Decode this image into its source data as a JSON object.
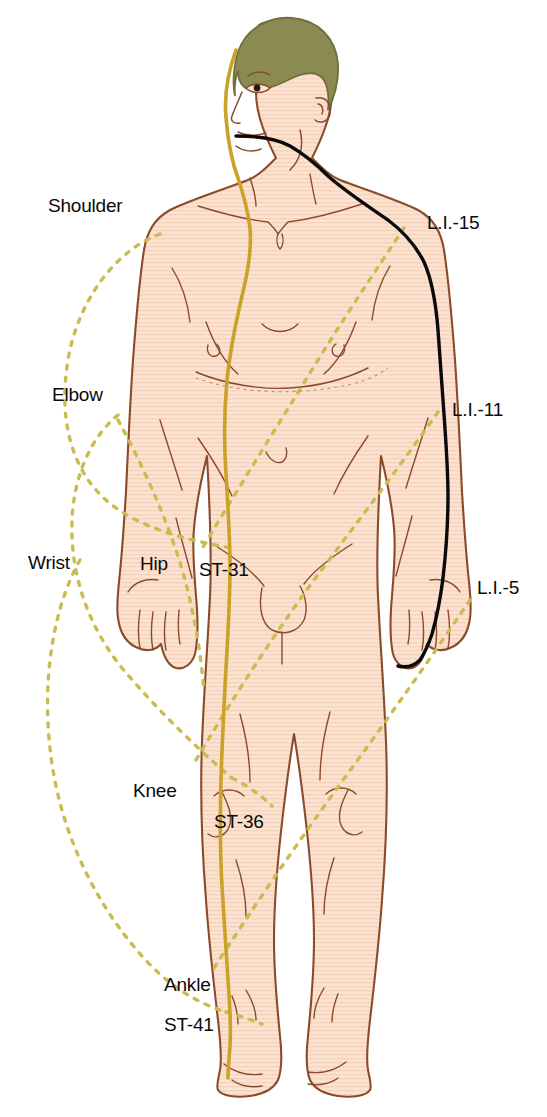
{
  "figure": {
    "background_color": "#ffffff"
  },
  "colors": {
    "skin_fill": "#fbe3d2",
    "skin_hatch": "#f3cdb6",
    "body_outline": "#8a4b2a",
    "hair_fill": "#8b8a52",
    "hair_outline": "#6f6e3c",
    "stomach_meridian": "#c9a227",
    "large_intestine_meridian": "#0a0a0a",
    "correspondence_dashed": "#c9bc50",
    "label_text": "#0a0a0a"
  },
  "labels": {
    "joints": [
      {
        "id": "shoulder",
        "text": "Shoulder"
      },
      {
        "id": "elbow",
        "text": "Elbow"
      },
      {
        "id": "wrist",
        "text": "Wrist"
      },
      {
        "id": "hip",
        "text": "Hip"
      },
      {
        "id": "knee",
        "text": "Knee"
      },
      {
        "id": "ankle",
        "text": "Ankle"
      }
    ],
    "stomach_points": [
      {
        "id": "st31",
        "text": "ST-31"
      },
      {
        "id": "st36",
        "text": "ST-36"
      },
      {
        "id": "st41",
        "text": "ST-41"
      }
    ],
    "large_intestine_points": [
      {
        "id": "li15",
        "text": "L.I.-15"
      },
      {
        "id": "li11",
        "text": "L.I.-11"
      },
      {
        "id": "li5",
        "text": "L.I.-5"
      }
    ]
  },
  "meridians": [
    {
      "id": "stomach",
      "name": "Stomach meridian",
      "abbrev": "ST",
      "color": "#c9a227",
      "style": "solid",
      "points": [
        "ST-31",
        "ST-36",
        "ST-41"
      ],
      "side": "figure-left"
    },
    {
      "id": "large-intestine",
      "name": "Large Intestine meridian",
      "abbrev": "L.I.",
      "color": "#0a0a0a",
      "style": "solid",
      "points": [
        "L.I.-15",
        "L.I.-11",
        "L.I.-5"
      ],
      "side": "figure-right"
    }
  ],
  "correspondences": [
    {
      "upper": "Shoulder",
      "lower": "Hip"
    },
    {
      "upper": "Elbow",
      "lower": "Knee"
    },
    {
      "upper": "Wrist",
      "lower": "Ankle"
    }
  ]
}
